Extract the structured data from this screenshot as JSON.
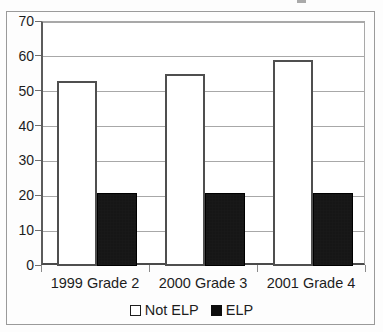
{
  "chart_data": {
    "type": "bar",
    "title": "",
    "subtitle": "",
    "xlabel": "",
    "ylabel": "",
    "categories": [
      "1999 Grade 2",
      "2000 Grade 3",
      "2001 Grade 4"
    ],
    "series": [
      {
        "name": "Not ELP",
        "values": [
          53,
          55,
          59
        ],
        "style": "open",
        "color": "#ffffff",
        "edge_color": "#4f4f4f"
      },
      {
        "name": "ELP",
        "values": [
          21,
          21,
          21
        ],
        "style": "filled",
        "color": "#0d0d0d",
        "edge_color": "#000000"
      }
    ],
    "ylim": [
      0,
      70
    ],
    "yticks": [
      0,
      10,
      20,
      30,
      40,
      50,
      60,
      70
    ],
    "ytick_labels": [
      "0",
      "10",
      "20",
      "30",
      "40",
      "50",
      "60",
      "70"
    ],
    "grid": true,
    "grid_axis": "y",
    "legend": {
      "position": "bottom",
      "entries": [
        {
          "label": "Not ELP",
          "swatch": "open-square"
        },
        {
          "label": "ELP",
          "swatch": "filled-square"
        }
      ]
    }
  }
}
